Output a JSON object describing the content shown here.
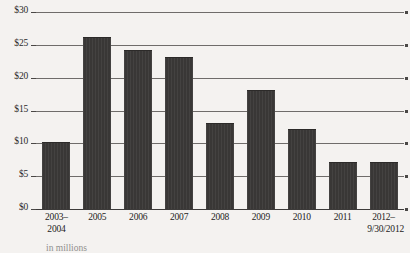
{
  "chart_data": {
    "type": "bar",
    "title": "",
    "xlabel": "",
    "ylabel": "",
    "ylim": [
      0,
      30
    ],
    "grid": true,
    "legend": false,
    "categories": [
      "2003–2004",
      "2005",
      "2006",
      "2007",
      "2008",
      "2009",
      "2010",
      "2011",
      "2012–9/30/2012"
    ],
    "category_lines": [
      [
        "2003–",
        "2004"
      ],
      [
        "2005",
        ""
      ],
      [
        "2006",
        ""
      ],
      [
        "2007",
        ""
      ],
      [
        "2008",
        ""
      ],
      [
        "2009",
        ""
      ],
      [
        "2010",
        ""
      ],
      [
        "2011",
        ""
      ],
      [
        "2012–",
        "9/30/2012"
      ]
    ],
    "values": [
      10,
      26,
      24,
      23,
      13,
      18,
      12,
      7,
      7
    ],
    "ytick_values": [
      0,
      5,
      10,
      15,
      20,
      25,
      30
    ],
    "ytick_labels": [
      "$0",
      "$5",
      "$10",
      "$15",
      "$20",
      "$25",
      "$30"
    ],
    "bar_color": "#393736",
    "gridline_color": "#6f6c6a",
    "axis_color": "#3d3b3a",
    "background_color": "#f4f2f0",
    "text_color": "#242322",
    "caption": "in millions"
  }
}
